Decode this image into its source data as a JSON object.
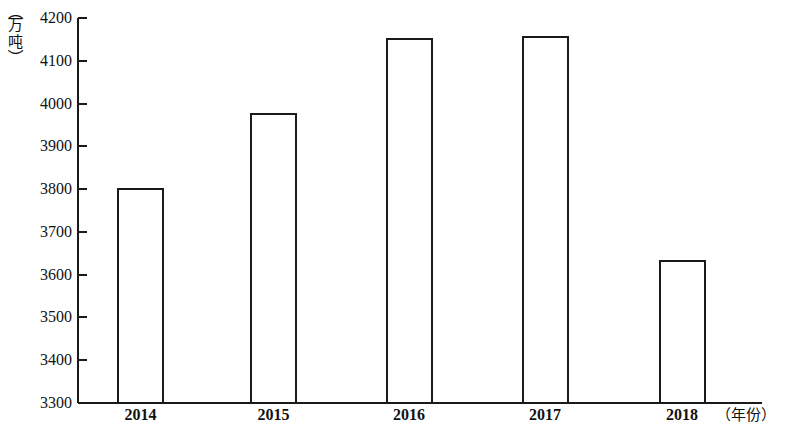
{
  "chart_data": {
    "type": "bar",
    "title": "",
    "subtitle": "",
    "xlabel": "（年份）",
    "ylabel": "（万吨）",
    "categories": [
      "2014",
      "2015",
      "2016",
      "2017",
      "2018"
    ],
    "values": [
      3800,
      3975,
      4150,
      4155,
      3633
    ],
    "ylim": [
      3300,
      4200
    ],
    "ytick_step": 100,
    "yticks": [
      4200,
      4100,
      4000,
      3900,
      3800,
      3700,
      3600,
      3500,
      3400,
      3300
    ],
    "ytick_labels": [
      "4200",
      "4100",
      "4000",
      "3900",
      "3800",
      "3700",
      "3600",
      "3500",
      "3400",
      "3300"
    ],
    "grid": false,
    "legend": false,
    "legend_position": "none",
    "bar_style": "outlined",
    "bar_fill": "#ffffff",
    "bar_stroke": "#1a1a1a",
    "axis_color": "#1a1a1a"
  },
  "axes": {
    "y_caption_chars": [
      "（",
      "万",
      "吨",
      "）"
    ],
    "x_caption": "（年份）"
  }
}
